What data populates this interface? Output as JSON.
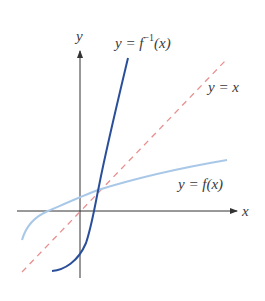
{
  "diagram": {
    "colors": {
      "axis": "#333333",
      "f": "#a9c8e8",
      "f_inverse": "#2a4f9a",
      "identity_line": "#e8908f",
      "label": "#3a3a3a"
    },
    "axes": {
      "x_label": "x",
      "y_label": "y"
    },
    "curves": [
      {
        "id": "f_inverse",
        "label_prefix": "y = f",
        "label_sup": "−1",
        "label_suffix": "(x)",
        "style": "solid"
      },
      {
        "id": "identity",
        "label": "y = x",
        "style": "dashed"
      },
      {
        "id": "f",
        "label": "y = f(x)",
        "style": "solid"
      }
    ]
  }
}
